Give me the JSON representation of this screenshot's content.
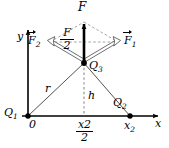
{
  "figure": {
    "type": "physics-vector-diagram",
    "background_color": "#ffffff",
    "stroke_color": "#000000",
    "dashed_color": "#7a7a7a"
  },
  "axes": {
    "x_label": "x",
    "y_label": "y",
    "origin_label": "0"
  },
  "charges": {
    "q1": {
      "label": "Q",
      "sub": "1"
    },
    "q2": {
      "label": "Q",
      "sub": "2"
    },
    "q3": {
      "label": "Q",
      "sub": "3"
    }
  },
  "vectors": {
    "resultant": {
      "label": "F",
      "sub": ""
    },
    "f1": {
      "label": "F",
      "sub": "1"
    },
    "f2": {
      "label": "F",
      "sub": "2"
    },
    "half_resultant": {
      "numerator": "F",
      "denominator": "2"
    }
  },
  "distances": {
    "r": "r",
    "h": "h"
  },
  "ticks": {
    "x2": {
      "label": "x",
      "sub": "2"
    },
    "x2_over_2": {
      "numerator": "x",
      "numerator_sub": "2",
      "denominator": "2"
    }
  },
  "geometry": {
    "origin": [
      28,
      116
    ],
    "q2_point": [
      130,
      116
    ],
    "q3_point": [
      84,
      63
    ],
    "rhombus_top": [
      84,
      22
    ],
    "rhombus_left": [
      50,
      42
    ],
    "rhombus_right": [
      118,
      42
    ],
    "f_arrow_tip": [
      84,
      22
    ],
    "y_axis_top": [
      28,
      28
    ],
    "x_axis_right": [
      160,
      116
    ]
  }
}
